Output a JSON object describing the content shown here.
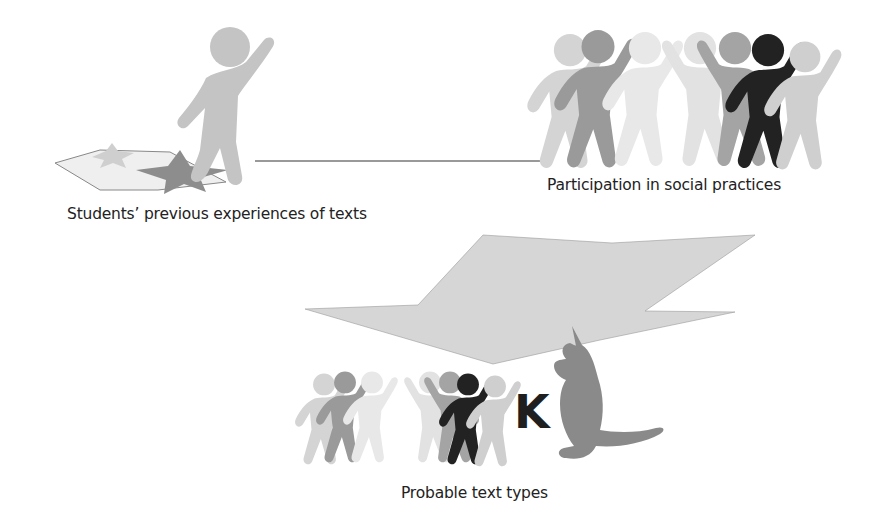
{
  "diagram": {
    "nodes": [
      {
        "id": "students",
        "label": "Students’ previous experiences of texts",
        "icon": "single-figure-on-stars"
      },
      {
        "id": "participation",
        "label": "Participation in social practices",
        "icon": "group-of-figures"
      },
      {
        "id": "probable",
        "label": "Probable text types",
        "icon": "group-with-letter-k-and-kangaroo"
      }
    ],
    "connectors": [
      {
        "from": "students",
        "to": "participation",
        "type": "line"
      },
      {
        "from": "students-participation-line",
        "to": "probable",
        "type": "funnel-arrow"
      }
    ],
    "center_letter": "K"
  },
  "colors": {
    "light": "#d2d2d2",
    "lighter": "#e6e6e6",
    "mid": "#a9a9a9",
    "dark": "#888888",
    "black": "#1f1f1f",
    "funnel": "#d6d6d6",
    "text": "#222222"
  }
}
